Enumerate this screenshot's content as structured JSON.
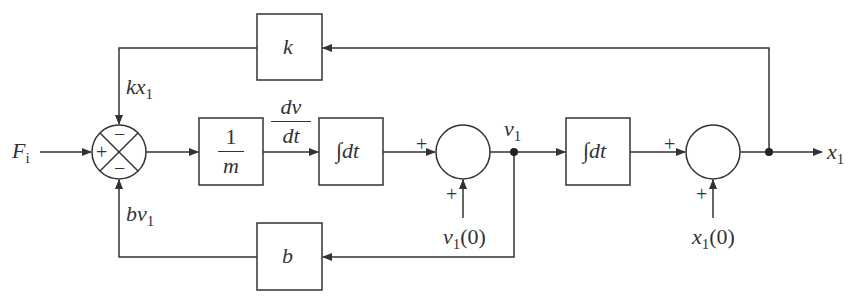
{
  "diagram": {
    "input_label": "F",
    "input_sub": "i",
    "output_label": "x",
    "output_sub": "1",
    "blocks": {
      "k": {
        "label": "k"
      },
      "inv_m": {
        "num": "1",
        "den": "m"
      },
      "int1": {
        "label": "∫dt"
      },
      "int2": {
        "label": "∫dt"
      },
      "b": {
        "label": "b"
      }
    },
    "signals": {
      "kx1": {
        "main": "kx",
        "sub": "1"
      },
      "bv1": {
        "main": "bv",
        "sub": "1"
      },
      "dvdt": {
        "num": "dv",
        "den": "dt"
      },
      "v1": {
        "main": "v",
        "sub": "1"
      },
      "v1_0": {
        "main": "v",
        "sub": "1",
        "suffix": "(0)"
      },
      "x1_0": {
        "main": "x",
        "sub": "1",
        "suffix": "(0)"
      }
    },
    "signs": {
      "sum1_left": "+",
      "sum1_top": "−",
      "sum1_bottom": "−",
      "sum2_left": "+",
      "sum2_bottom": "+",
      "sum3_left": "+",
      "sum3_bottom": "+"
    },
    "colors": {
      "line": "#333333",
      "background": "#ffffff"
    }
  }
}
